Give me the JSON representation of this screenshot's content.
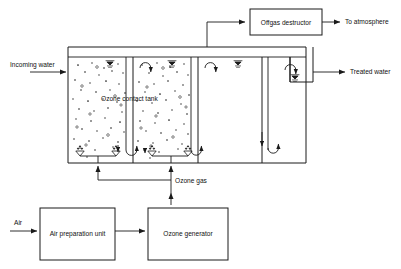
{
  "diagram": {
    "type": "process-flow",
    "stroke_color": "#1a1a1a",
    "background_color": "#ffffff",
    "labels": {
      "incoming_water": "Incoming water",
      "treated_water": "Treated water",
      "ozone_contact_tank": "Ozone contact tank",
      "ozone_gas": "Ozone gas",
      "to_atmosphere": "To atmosphere",
      "air": "Air"
    },
    "boxes": [
      {
        "id": "offgas-destructor",
        "label": "Offgas destructor"
      },
      {
        "id": "air-preparation-unit",
        "label": "Air preparation unit"
      },
      {
        "id": "ozone-generator",
        "label": "Ozone generator"
      }
    ],
    "streams": [
      {
        "id": "incoming-water",
        "label": "Incoming water",
        "direction": "right"
      },
      {
        "id": "treated-water",
        "label": "Treated water",
        "direction": "right"
      },
      {
        "id": "offgas",
        "label": "",
        "direction": "up-right"
      },
      {
        "id": "to-atmosphere",
        "label": "To atmosphere",
        "direction": "right"
      },
      {
        "id": "air",
        "label": "Air",
        "direction": "right"
      },
      {
        "id": "ozone-gas",
        "label": "Ozone gas",
        "direction": "up"
      }
    ],
    "tank": {
      "chambers": 3,
      "diffusers": 4,
      "bubble_chambers": 2,
      "clear_chamber": 1,
      "water_level_markers": 4
    }
  }
}
